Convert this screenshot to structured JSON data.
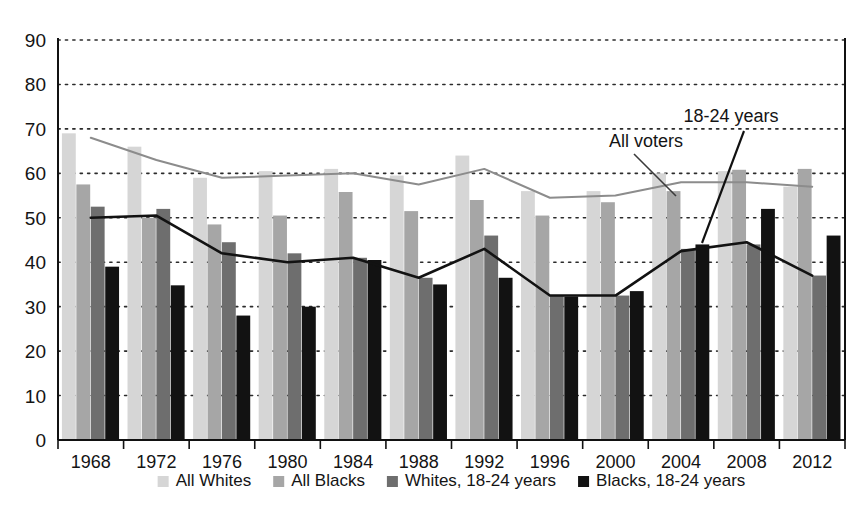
{
  "chart_data": {
    "type": "bar",
    "title": "",
    "subtitle": "",
    "xlabel": "",
    "ylabel": "",
    "xlim": [
      1966,
      2014
    ],
    "ylim": [
      0,
      90
    ],
    "yticks": [
      0,
      10,
      20,
      30,
      40,
      50,
      60,
      70,
      80,
      90
    ],
    "grid": "horizontal-dotted",
    "legend_position": "bottom",
    "categories": [
      "1968",
      "1972",
      "1976",
      "1980",
      "1984",
      "1988",
      "1992",
      "1996",
      "2000",
      "2004",
      "2008",
      "2012"
    ],
    "series": [
      {
        "name": "All Whites",
        "kind": "bar",
        "color": "#d6d6d6",
        "values": [
          69,
          66,
          59,
          60.5,
          61,
          59.5,
          64,
          56,
          56,
          60,
          60.5,
          57
        ]
      },
      {
        "name": "All Blacks",
        "kind": "bar",
        "color": "#a6a6a6",
        "values": [
          57.5,
          50,
          48.5,
          50.5,
          55.8,
          51.5,
          54,
          50.5,
          53.5,
          56,
          60.8,
          61
        ]
      },
      {
        "name": "Whites, 18-24 years",
        "kind": "bar",
        "color": "#6e6e6e",
        "values": [
          52.5,
          52,
          44.5,
          42,
          41,
          36.5,
          46,
          32.5,
          32.5,
          43,
          44,
          37
        ]
      },
      {
        "name": "Blacks, 18-24 years",
        "kind": "bar",
        "color": "#121212",
        "values": [
          39,
          34.8,
          28,
          30,
          40.5,
          35,
          36.5,
          32.3,
          33.5,
          44,
          52,
          46
        ]
      },
      {
        "name": "All voters",
        "kind": "line",
        "color": "#8c8c8c",
        "values": [
          68,
          63,
          59,
          59.5,
          60,
          57.5,
          61,
          54.5,
          55,
          58,
          58,
          57
        ]
      },
      {
        "name": "18-24 years",
        "kind": "line",
        "color": "#121212",
        "values": [
          50,
          50.5,
          42,
          40,
          41,
          36.5,
          43,
          32.5,
          32.5,
          42.5,
          44.5,
          37
        ]
      }
    ],
    "annotations": [
      {
        "text": "All voters",
        "series": "All voters",
        "x": 646,
        "y": 147
      },
      {
        "text": "18-24 years",
        "series": "18-24 years",
        "x": 731,
        "y": 122
      }
    ],
    "legend": [
      {
        "label": "All Whites",
        "color": "#d6d6d6"
      },
      {
        "label": "All Blacks",
        "color": "#a6a6a6"
      },
      {
        "label": "Whites, 18-24 years",
        "color": "#6e6e6e"
      },
      {
        "label": "Blacks, 18-24 years",
        "color": "#121212"
      }
    ]
  },
  "axis": {
    "y_labels": [
      "90",
      "80",
      "70",
      "60",
      "50",
      "40",
      "30",
      "20",
      "10",
      "0"
    ],
    "x_labels": [
      "1968",
      "1972",
      "1976",
      "1980",
      "1984",
      "1988",
      "1992",
      "1996",
      "2000",
      "2004",
      "2008",
      "2012"
    ]
  }
}
